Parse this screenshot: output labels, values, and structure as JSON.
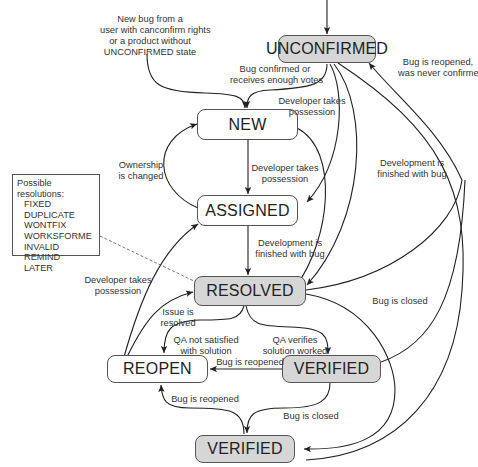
{
  "diagram": {
    "states": {
      "unconfirmed": "UNCONFIRMED",
      "new": "NEW",
      "assigned": "ASSIGNED",
      "resolved": "RESOLVED",
      "reopen": "REOPEN",
      "verified": "VERIFIED",
      "verified_closed": "VERIFIED"
    },
    "state_fill": {
      "gray": "#d6d6d6",
      "white": "#ffffff"
    },
    "labels": {
      "new_bug_line1": "New bug from a",
      "new_bug_line2": "user with canconfirm rights",
      "new_bug_line3": "or a product without",
      "new_bug_line4": "UNCONFIRMED state",
      "confirmed_line1": "Bug confirmed or",
      "confirmed_line2": "receives enough votes",
      "dev_takes_top_line1": "Developer takes",
      "dev_takes_top_line2": "possession",
      "reopened_never_line1": "Bug is reopened,",
      "reopened_never_line2": "was never confirmed",
      "ownership_line1": "Ownership",
      "ownership_line2": "is changed",
      "dev_takes_mid_line1": "Developer takes",
      "dev_takes_mid_line2": "possession",
      "dev_finished_right_line1": "Development is",
      "dev_finished_right_line2": "finished with bug",
      "dev_finished_mid_line1": "Development is",
      "dev_finished_mid_line2": "finished with bug",
      "dev_takes_left_line1": "Developer takes",
      "dev_takes_left_line2": "possession",
      "issue_resolved_line1": "Issue is",
      "issue_resolved_line2": "resolved",
      "bug_closed_right": "Bug is closed",
      "qa_not_line1": "QA not satisfied",
      "qa_not_line2": "with solution",
      "qa_ok_line1": "QA verifies",
      "qa_ok_line2": "solution worked",
      "reopened_mid": "Bug is reopened",
      "reopened_low": "Bug is reopened",
      "bug_closed_low": "Bug is closed"
    },
    "resolutions": {
      "title": "Possible resolutions:",
      "items": [
        "FIXED",
        "DUPLICATE",
        "WONTFIX",
        "WORKSFORME",
        "INVALID",
        "REMIND",
        "LATER"
      ]
    },
    "transitions": [
      {
        "from": "(start)",
        "to": "UNCONFIRMED",
        "label": ""
      },
      {
        "from": "(start)",
        "to": "NEW",
        "label": "New bug from a user with canconfirm rights or a product without UNCONFIRMED state"
      },
      {
        "from": "UNCONFIRMED",
        "to": "NEW",
        "label": "Bug confirmed or receives enough votes"
      },
      {
        "from": "UNCONFIRMED",
        "to": "ASSIGNED",
        "label": "Developer takes possession"
      },
      {
        "from": "UNCONFIRMED",
        "to": "RESOLVED",
        "label": "Development is finished with bug"
      },
      {
        "from": "UNCONFIRMED",
        "to": "VERIFIED (bottom)",
        "label": ""
      },
      {
        "from": "RESOLVED",
        "to": "UNCONFIRMED",
        "label": "Bug is reopened, was never confirmed"
      },
      {
        "from": "NEW",
        "to": "ASSIGNED",
        "label": "Developer takes possession"
      },
      {
        "from": "ASSIGNED",
        "to": "NEW",
        "label": "Ownership is changed"
      },
      {
        "from": "NEW",
        "to": "RESOLVED",
        "label": ""
      },
      {
        "from": "ASSIGNED",
        "to": "RESOLVED",
        "label": "Development is finished with bug"
      },
      {
        "from": "REOPEN",
        "to": "ASSIGNED",
        "label": "Developer takes possession"
      },
      {
        "from": "REOPEN",
        "to": "RESOLVED",
        "label": "Issue is resolved"
      },
      {
        "from": "RESOLVED",
        "to": "REOPEN",
        "label": "QA not satisfied with solution"
      },
      {
        "from": "RESOLVED",
        "to": "VERIFIED",
        "label": "QA verifies solution worked"
      },
      {
        "from": "RESOLVED",
        "to": "VERIFIED (bottom)",
        "label": "Bug is closed"
      },
      {
        "from": "VERIFIED",
        "to": "REOPEN",
        "label": "Bug is reopened"
      },
      {
        "from": "VERIFIED",
        "to": "VERIFIED (bottom)",
        "label": "Bug is closed"
      },
      {
        "from": "VERIFIED",
        "to": "UNCONFIRMED",
        "label": ""
      },
      {
        "from": "VERIFIED (bottom)",
        "to": "REOPEN",
        "label": "Bug is reopened"
      }
    ]
  }
}
